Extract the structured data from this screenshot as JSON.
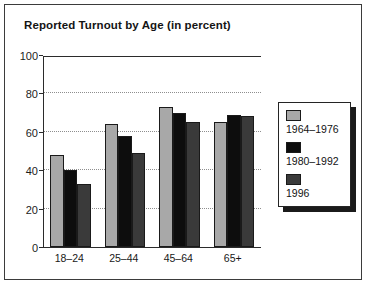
{
  "figure": {
    "title": "Reported Turnout by Age (in percent)",
    "background_color": "#ffffff",
    "frame_color": "#3b3b3b"
  },
  "legend": {
    "position": "right",
    "entries": [
      {
        "label": "1964–1976",
        "color": "#a8a8a8",
        "swatch_name": "legend-swatch-1964-1976"
      },
      {
        "label": "1980–1992",
        "color": "#0d0d0d",
        "swatch_name": "legend-swatch-1980-1992"
      },
      {
        "label": "1996",
        "color": "#3a3a3a",
        "swatch_name": "legend-swatch-1996"
      }
    ]
  },
  "axes": {
    "y_ticks": [
      "100",
      "80",
      "60",
      "40",
      "20",
      "0"
    ],
    "x_labels": [
      "18–24",
      "25–44",
      "45–64",
      "65+"
    ]
  },
  "chart_data": {
    "type": "bar",
    "title": "Reported Turnout by Age (in percent)",
    "xlabel": "",
    "ylabel": "",
    "ylim": [
      0,
      100
    ],
    "yticks": [
      0,
      20,
      40,
      60,
      80,
      100
    ],
    "grid": true,
    "legend_position": "right",
    "categories": [
      "18–24",
      "25–44",
      "45–64",
      "65+"
    ],
    "series": [
      {
        "name": "1964–1976",
        "color": "#a8a8a8",
        "values": [
          48,
          64,
          73,
          65
        ]
      },
      {
        "name": "1980–1992",
        "color": "#0d0d0d",
        "values": [
          40,
          58,
          70,
          69
        ]
      },
      {
        "name": "1996",
        "color": "#3a3a3a",
        "values": [
          33,
          49,
          65,
          68
        ]
      }
    ]
  }
}
